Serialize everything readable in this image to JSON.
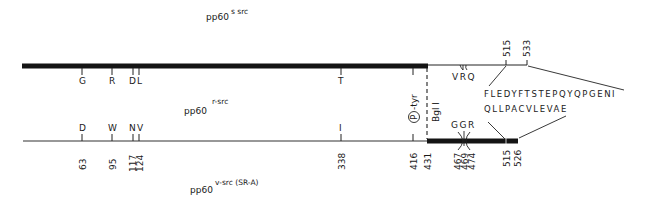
{
  "titles": {
    "top": {
      "base": "pp60",
      "superscript": "s  src"
    },
    "middle": {
      "base": "pp60",
      "superscript": "r-src"
    },
    "bottom": {
      "base": "pp60",
      "superscript": "v-src (SR-A)"
    }
  },
  "top_protein": {
    "name": "pp60 r-src",
    "residue_labels": [
      {
        "position": 63,
        "residue": "G"
      },
      {
        "position": 95,
        "residue": "R"
      },
      {
        "position": 117,
        "residue": "D"
      },
      {
        "position": 124,
        "residue": "L"
      },
      {
        "position": 338,
        "residue": "T"
      },
      {
        "position": 416,
        "residue": ""
      }
    ],
    "mutation_cluster": {
      "residues": "VRQ",
      "positions": [
        467,
        469,
        474
      ]
    },
    "end_numbers": [
      "515",
      "533"
    ],
    "c_terminal_sequence": "FLEDYFTSTEPQYQPGENI"
  },
  "bottom_protein": {
    "name": "pp60 v-src (SR-A)",
    "residue_labels": [
      {
        "position": 63,
        "residue": "D"
      },
      {
        "position": 95,
        "residue": "W"
      },
      {
        "position": 117,
        "residue": "N"
      },
      {
        "position": 124,
        "residue": "V"
      },
      {
        "position": 338,
        "residue": "I"
      },
      {
        "position": 416,
        "residue": ""
      }
    ],
    "mutation_cluster": {
      "residues": "GGR",
      "positions": [
        467,
        469,
        474
      ]
    },
    "position_numbers": [
      "63",
      "95",
      "117",
      "124",
      "338",
      "416",
      "431",
      "467",
      "469",
      "474",
      "515",
      "526"
    ],
    "c_terminal_sequence": "QLLPACVLEVAE"
  },
  "annotations": {
    "phospho_site": {
      "circle_letter": "P",
      "text": "-tyr"
    },
    "restriction_site": "Bgl I"
  }
}
